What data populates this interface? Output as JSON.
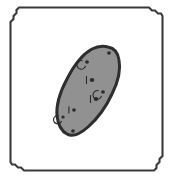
{
  "figure": {
    "caption": "",
    "width": 173,
    "height": 179,
    "background_color": "#ffffff"
  },
  "frame": {
    "name": "chamfered-rectangle-border",
    "stroke_color": "#3a3a3a",
    "fill_color": "#ffffff",
    "stroke_width": 2.1,
    "left": 9,
    "top": 7,
    "right": 163,
    "bottom": 171,
    "chamfer": 14,
    "chamfer_style": "stair-step",
    "path": "M 23 7.5 L 149 7.5 L 152 10.5 L 155 10.5 L 158 13.5 L 161 13.5 L 162.5 16 L 162.5 156 L 159.5 159 L 159.5 162 L 156.5 165 L 156.5 168 L 154 170.5 L 24 170.5 L 21 167.5 L 18 167.5 L 15 164.5 L 12 164.5 L 10.5 162 L 10.5 22 L 13.5 19 L 13.5 16 L 16.5 13 L 16.5 10 L 19 7.5 Z"
  },
  "blob": {
    "name": "potato-body",
    "fill_color": "#919191",
    "stroke_color": "#2e2e2e",
    "stroke_width": 3.0,
    "orientation": "tilted ellipse, major axis from lower-left to upper-right",
    "tilt_degrees": 33,
    "center_x": 89,
    "center_y": 90,
    "major_axis": 96,
    "minor_axis": 48,
    "path": "M 108 47 C 114 48 118 53 119 60 C 121 70 118 82 112 94 C 106 107 97 119 88 127 C 80 134 72 137 67 134 C 61 131 58 124 57 116 C 56 105 60 92 67 79 C 74 65 83 54 92 49 C 98 46 104 46 108 47 Z"
  },
  "spots": [
    {
      "name": "spot-top-right",
      "cx": 109,
      "cy": 53,
      "rx": 1.9,
      "ry": 1.7,
      "has_ring": false,
      "has_tick": false
    },
    {
      "name": "spot-upper-left",
      "cx": 87,
      "cy": 62,
      "rx": 1.9,
      "ry": 1.7,
      "has_ring": true,
      "has_tick": false
    },
    {
      "name": "spot-center-eye",
      "cx": 92,
      "cy": 80,
      "rx": 2.3,
      "ry": 2.0,
      "has_ring": false,
      "has_tick": true
    },
    {
      "name": "spot-mid-right",
      "cx": 103,
      "cy": 92,
      "rx": 1.9,
      "ry": 1.7,
      "has_ring": true,
      "has_tick": false
    },
    {
      "name": "spot-lower-eye",
      "cx": 96,
      "cy": 99,
      "rx": 2.3,
      "ry": 2.0,
      "has_ring": false,
      "has_tick": true
    },
    {
      "name": "spot-lower-center",
      "cx": 74,
      "cy": 110,
      "rx": 1.9,
      "ry": 1.7,
      "has_ring": false,
      "has_tick": true
    },
    {
      "name": "spot-lower-left",
      "cx": 63,
      "cy": 117,
      "rx": 1.7,
      "ry": 1.6,
      "has_ring": true,
      "has_tick": false
    },
    {
      "name": "spot-bottom-tip",
      "cx": 73,
      "cy": 131,
      "rx": 1.9,
      "ry": 1.7,
      "has_ring": false,
      "has_tick": false
    }
  ]
}
